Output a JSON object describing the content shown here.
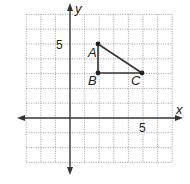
{
  "diagram": {
    "type": "coordinate-grid",
    "axes": {
      "x_label": "x",
      "y_label": "y",
      "x_range": [
        -3,
        7
      ],
      "y_range": [
        -3,
        7
      ],
      "x_tick_label": "5",
      "y_tick_label": "5"
    },
    "points": [
      {
        "name": "A",
        "x": 2,
        "y": 5
      },
      {
        "name": "B",
        "x": 2,
        "y": 3
      },
      {
        "name": "C",
        "x": 5,
        "y": 3
      }
    ],
    "segments": [
      [
        "A",
        "B"
      ],
      [
        "B",
        "C"
      ],
      [
        "C",
        "A"
      ]
    ],
    "colors": {
      "grid": "#9a9a9a",
      "axis": "#333333",
      "shape": "#333333",
      "text": "#222222"
    }
  }
}
